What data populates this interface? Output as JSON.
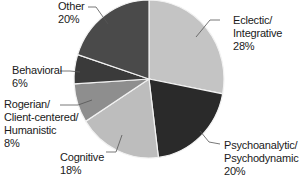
{
  "chart_data": {
    "type": "pie",
    "title": "",
    "start_angle_deg": 0,
    "direction": "clockwise",
    "slices": [
      {
        "label": "Eclectic/ Integrative",
        "lines": [
          "Eclectic/",
          "Integrative"
        ],
        "pct_label": "28%",
        "value": 28,
        "color": "#c4c4c4"
      },
      {
        "label": "Psychoanalytic/ Psychodynamic",
        "lines": [
          "Psychoanalytic/",
          "Psychodynamic"
        ],
        "pct_label": "20%",
        "value": 20,
        "color": "#2a2a2a"
      },
      {
        "label": "Cognitive",
        "lines": [
          "Cognitive"
        ],
        "pct_label": "18%",
        "value": 18,
        "color": "#bdbdbd"
      },
      {
        "label": "Rogerian/ Client-centered/ Humanistic",
        "lines": [
          "Rogerian/",
          "Client-centered/",
          "Humanistic"
        ],
        "pct_label": "8%",
        "value": 8,
        "color": "#8e8e8e"
      },
      {
        "label": "Behavioral",
        "lines": [
          "Behavioral"
        ],
        "pct_label": "6%",
        "value": 6,
        "color": "#3a3a3a"
      },
      {
        "label": "Other",
        "lines": [
          "Other"
        ],
        "pct_label": "20%",
        "value": 20,
        "color": "#4a4a4a"
      }
    ]
  },
  "labels": {
    "eclectic": {
      "l1": "Eclectic/",
      "l2": "Integrative",
      "pct": "28%"
    },
    "psycho": {
      "l1": "Psychoanalytic/",
      "l2": "Psychodynamic",
      "pct": "20%"
    },
    "cognitive": {
      "l1": "Cognitive",
      "pct": "18%"
    },
    "rogerian": {
      "l1": "Rogerian/",
      "l2": "Client-centered/",
      "l3": "Humanistic",
      "pct": "8%"
    },
    "behavioral": {
      "l1": "Behavioral",
      "pct": "6%"
    },
    "other": {
      "l1": "Other",
      "pct": "20%"
    }
  }
}
